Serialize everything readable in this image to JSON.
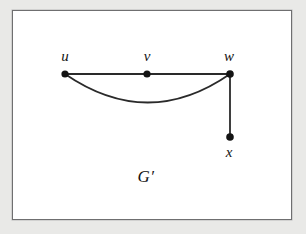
{
  "figure": {
    "name": "G′",
    "name_x": 146,
    "name_y": 176,
    "background_color": "#e9e9e7",
    "panel_color": "#ffffff",
    "border_color": "#6f6f70",
    "ink_color": "#141414"
  },
  "frame": {
    "x": 12,
    "y": 10,
    "width": 280,
    "height": 210
  },
  "graph_data": {
    "type": "diagram",
    "diagram_kind": "undirected-graph",
    "title": "G′",
    "vertices": [
      {
        "id": "u",
        "label": "u",
        "x": 65,
        "y": 74,
        "r": 3.6,
        "label_x": 65,
        "label_y": 56,
        "label_pos": "above"
      },
      {
        "id": "v",
        "label": "v",
        "x": 147,
        "y": 74,
        "r": 3.6,
        "label_x": 147,
        "label_y": 56,
        "label_pos": "above"
      },
      {
        "id": "w",
        "label": "w",
        "x": 230,
        "y": 74,
        "r": 3.8,
        "label_x": 229,
        "label_y": 56,
        "label_pos": "above"
      },
      {
        "id": "x",
        "label": "x",
        "x": 230,
        "y": 137,
        "r": 3.8,
        "label_x": 229,
        "label_y": 152,
        "label_pos": "below"
      }
    ],
    "edges": [
      {
        "id": "uv",
        "from": "u",
        "to": "v",
        "shape": "straight",
        "path": "M 65 74 L 147 74"
      },
      {
        "id": "vw",
        "from": "v",
        "to": "w",
        "shape": "straight",
        "path": "M 147 74 L 230 74"
      },
      {
        "id": "uw-curve",
        "from": "u",
        "to": "w",
        "shape": "curved",
        "path": "M 65 74 Q 148 131 230 74"
      },
      {
        "id": "wx",
        "from": "w",
        "to": "x",
        "shape": "straight",
        "path": "M 230 74 L 230 137"
      }
    ],
    "edge_color": "#2a2a2a",
    "edge_width": 1.8,
    "vertex_color": "#141414"
  }
}
